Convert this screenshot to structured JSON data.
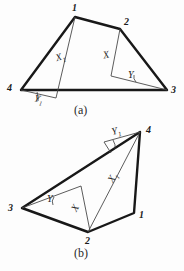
{
  "document": {
    "kind": "geometry-diagram",
    "background_color": "#fdfdfd",
    "ink_color": "#1b1b1b",
    "thin_ink_color": "#555555",
    "width": 184,
    "height": 271
  },
  "figures": [
    {
      "id": "a",
      "caption": "(a)",
      "caption_pos": {
        "x": 74,
        "y": 104
      },
      "outline": [
        {
          "label": "1",
          "x": 75,
          "y": 17
        },
        {
          "label": "2",
          "x": 120,
          "y": 29
        },
        {
          "label": "3",
          "x": 167,
          "y": 90
        },
        {
          "label": "4",
          "x": 21,
          "y": 90
        }
      ],
      "vertex_labels": [
        {
          "text": "1",
          "x": 72,
          "y": 3
        },
        {
          "text": "2",
          "x": 124,
          "y": 17
        },
        {
          "text": "3",
          "x": 171,
          "y": 85
        },
        {
          "text": "4",
          "x": 7,
          "y": 83
        }
      ],
      "construction_lines": [
        {
          "name": "diagonal-1-to-base",
          "x1": 75,
          "y1": 17,
          "x2": 56,
          "y2": 98
        },
        {
          "name": "base-spur-at-4",
          "x1": 21,
          "y1": 90,
          "x2": 56,
          "y2": 98
        },
        {
          "name": "spur-2-down",
          "x1": 120,
          "y1": 29,
          "x2": 111,
          "y2": 76
        },
        {
          "name": "spur-to-3",
          "x1": 111,
          "y1": 76,
          "x2": 167,
          "y2": 90
        }
      ],
      "angle_marks": [
        {
          "name": "angle-Y1-at-4",
          "vertex": {
            "x": 21,
            "y": 90
          },
          "a1": {
            "x": 40,
            "y": 93
          },
          "a2": {
            "x": 42,
            "y": 103
          }
        },
        {
          "name": "angle-Y-at-3",
          "vertex": {
            "x": 167,
            "y": 90
          },
          "a1": {
            "x": 130,
            "y": 82
          },
          "a2": {
            "x": 133,
            "y": 73
          }
        }
      ],
      "annotations": [
        {
          "text": "X",
          "sub": "1",
          "x": 56,
          "y": 52,
          "rotate": -18
        },
        {
          "text": "X",
          "sub": "",
          "x": 103,
          "y": 50,
          "rotate": -12
        },
        {
          "text": "Y",
          "sub": "",
          "x": 128,
          "y": 70,
          "rotate": 0
        },
        {
          "text": "Y",
          "sub": "1",
          "x": 34,
          "y": 94,
          "rotate": 12
        }
      ]
    },
    {
      "id": "b",
      "caption": "(b)",
      "caption_pos": {
        "x": 74,
        "y": 247
      },
      "outline": [
        {
          "label": "4",
          "x": 140,
          "y": 132
        },
        {
          "label": "3",
          "x": 22,
          "y": 208
        },
        {
          "label": "2",
          "x": 88,
          "y": 232
        },
        {
          "label": "1",
          "x": 134,
          "y": 213
        }
      ],
      "vertex_labels": [
        {
          "text": "4",
          "x": 146,
          "y": 125
        },
        {
          "text": "3",
          "x": 8,
          "y": 203
        },
        {
          "text": "2",
          "x": 85,
          "y": 236
        },
        {
          "text": "1",
          "x": 139,
          "y": 210
        }
      ],
      "construction_lines": [
        {
          "name": "diagonal-4-to-2",
          "x1": 140,
          "y1": 132,
          "x2": 88,
          "y2": 232
        },
        {
          "name": "spur-3-to-inner",
          "x1": 22,
          "y1": 208,
          "x2": 81,
          "y2": 186
        },
        {
          "name": "inner-to-2",
          "x1": 81,
          "y1": 186,
          "x2": 90,
          "y2": 231
        },
        {
          "name": "spur-top-left",
          "x1": 104,
          "y1": 142,
          "x2": 140,
          "y2": 132
        },
        {
          "name": "spur-top-down",
          "x1": 104,
          "y1": 142,
          "x2": 110,
          "y2": 152
        }
      ],
      "angle_marks": [
        {
          "name": "angle-Y-at-3",
          "vertex": {
            "x": 22,
            "y": 208
          },
          "a1": {
            "x": 58,
            "y": 196
          },
          "a2": {
            "x": 57,
            "y": 206
          }
        },
        {
          "name": "angle-Y1-at-4",
          "vertex": {
            "x": 140,
            "y": 132
          },
          "a1": {
            "x": 108,
            "y": 141
          },
          "a2": {
            "x": 112,
            "y": 150
          }
        }
      ],
      "annotations": [
        {
          "text": "Y",
          "sub": "1",
          "x": 112,
          "y": 126,
          "rotate": -14
        },
        {
          "text": "X",
          "sub": "1",
          "x": 109,
          "y": 172,
          "rotate": -58
        },
        {
          "text": "X",
          "sub": "",
          "x": 72,
          "y": 203,
          "rotate": -60
        },
        {
          "text": "Y",
          "sub": "",
          "x": 47,
          "y": 194,
          "rotate": 0
        }
      ]
    }
  ]
}
